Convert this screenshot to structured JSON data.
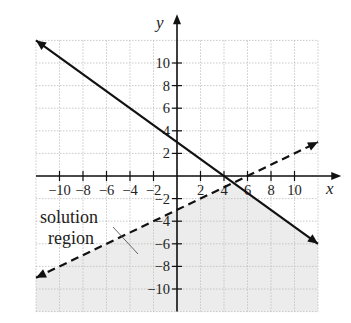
{
  "chart_data": {
    "type": "line",
    "title": "",
    "xlabel": "x",
    "ylabel": "y",
    "xlim": [
      -12,
      12
    ],
    "ylim": [
      -12,
      12
    ],
    "grid": true,
    "x_ticks": [
      -10,
      -8,
      -6,
      -4,
      -2,
      2,
      4,
      6,
      8,
      10
    ],
    "y_ticks": [
      10,
      8,
      6,
      4,
      2,
      -2,
      -4,
      -6,
      -8,
      -10
    ],
    "x_tick_labels": [
      "−10",
      "−8",
      "−6",
      "−4",
      "−2",
      "2",
      "4",
      "6",
      "8",
      "10"
    ],
    "y_tick_labels": [
      "10",
      "8",
      "6",
      "4",
      "2",
      "−2",
      "−4",
      "−6",
      "−8",
      "−10"
    ],
    "series": [
      {
        "name": "solid boundary line",
        "style": "solid",
        "equation": "y = -3/4 x + 3",
        "points": [
          [
            -12,
            12
          ],
          [
            12,
            -6
          ]
        ],
        "intercepts": {
          "x": 4,
          "y": 3
        }
      },
      {
        "name": "dashed boundary line",
        "style": "dashed",
        "equation": "y = 1/2 x - 3",
        "points": [
          [
            -12,
            -9
          ],
          [
            12,
            3
          ]
        ],
        "intercepts": {
          "x": 6,
          "y": -3
        }
      }
    ],
    "shaded_region": {
      "label": "solution region",
      "description": "below both lines",
      "color": "#ececec"
    },
    "annotations": [
      {
        "text": "solution",
        "line": 1
      },
      {
        "text": "region",
        "line": 2
      }
    ]
  },
  "labels": {
    "x_axis": "x",
    "y_axis": "y",
    "annotation_line1": "solution",
    "annotation_line2": "region"
  },
  "colors": {
    "line": "#111111",
    "grid": "#bdbdbd",
    "shade": "#ececec"
  }
}
